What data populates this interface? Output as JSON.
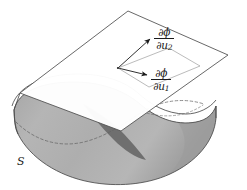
{
  "figure": {
    "type": "geometric-diagram",
    "width": 247,
    "height": 190,
    "background_color": "#ffffff"
  },
  "labels": {
    "partial_u2": {
      "numerator": "∂ϕ",
      "denominator_symbol": "∂u",
      "denominator_subscript": "2",
      "full": "∂ϕ/∂u₂"
    },
    "partial_u1": {
      "numerator": "∂ϕ",
      "denominator_symbol": "∂u",
      "denominator_subscript": "1",
      "full": "∂ϕ/∂u₁"
    },
    "surface": "S"
  },
  "colors": {
    "surface_light": "#b3b3b3",
    "surface_mid": "#a0a0a0",
    "surface_dark": "#7d7d7d",
    "surface_darker": "#6e6e6e",
    "outline": "#3a3a3a",
    "plane_fill": "#ffffff",
    "plane_stroke": "#4a4a4a",
    "arrow": "#1a1a1a",
    "dashed_curve": "#555555",
    "text": "#1a1a1a"
  },
  "geometry": {
    "tangent_plane_corners": [
      {
        "name": "top",
        "x": 128,
        "y": 11
      },
      {
        "name": "right",
        "x": 228,
        "y": 55
      },
      {
        "name": "bottom",
        "x": 121,
        "y": 131
      },
      {
        "name": "left",
        "x": 20,
        "y": 93
      }
    ],
    "tangent_point": {
      "x": 118,
      "y": 68
    },
    "arrow_u2_tip": {
      "x": 152,
      "y": 37
    },
    "arrow_u1_tip": {
      "x": 150,
      "y": 76
    },
    "surface_extent": {
      "left": 14,
      "right": 216,
      "top": 82,
      "bottom": 184
    }
  }
}
